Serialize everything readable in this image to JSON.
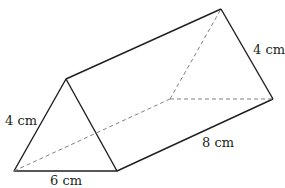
{
  "figure": {
    "type": "triangular-prism",
    "labels": {
      "front_left_edge": "4 cm",
      "front_base": "6 cm",
      "length": "8 cm",
      "back_right_edge": "4 cm"
    },
    "colors": {
      "solid_edge": "#231f20",
      "hidden_edge": "#808080"
    }
  }
}
